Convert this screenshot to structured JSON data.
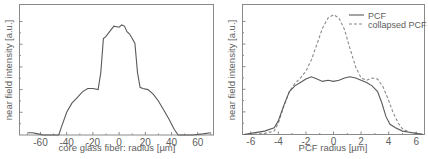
{
  "chart_data": [
    {
      "type": "line",
      "title": "",
      "xlabel": "core glass fiber: radius [µm]",
      "ylabel": "near field intensity [a.u.]",
      "xlim": [
        -76,
        72
      ],
      "ylim": [
        0,
        1.15
      ],
      "xticks": [
        -60,
        -40,
        -20,
        0,
        20,
        40,
        60
      ],
      "yticks_labeled": false,
      "grid": false,
      "legend": null,
      "series": [
        {
          "name": "core glass fiber",
          "style": "solid",
          "x": [
            -70,
            -66,
            -62,
            -58,
            -54,
            -50,
            -46,
            -44,
            -40,
            -36,
            -32,
            -28,
            -24,
            -20,
            -16,
            -14,
            -12,
            -10,
            -8,
            -4,
            0,
            2,
            4,
            6,
            8,
            10,
            12,
            14,
            16,
            18,
            22,
            26,
            30,
            34,
            38,
            42,
            45,
            48,
            56,
            64,
            70
          ],
          "y": [
            0.02,
            0.02,
            0.01,
            0.0,
            0.0,
            0.0,
            0.0,
            0.07,
            0.2,
            0.28,
            0.33,
            0.38,
            0.41,
            0.41,
            0.4,
            0.55,
            0.85,
            0.87,
            0.9,
            0.96,
            0.95,
            0.97,
            0.96,
            0.91,
            0.89,
            0.85,
            0.81,
            0.55,
            0.42,
            0.41,
            0.4,
            0.36,
            0.3,
            0.22,
            0.14,
            0.05,
            0.0,
            0.0,
            0.0,
            0.01,
            0.02
          ]
        }
      ]
    },
    {
      "type": "line",
      "title": "",
      "xlabel": "PCF radius [µm]",
      "ylabel": "near field intensity [a.u.]",
      "xlim": [
        -6.6,
        6.6
      ],
      "ylim": [
        0,
        1.15
      ],
      "xticks": [
        -6,
        -4,
        -2,
        0,
        2,
        4,
        6
      ],
      "yticks_labeled": false,
      "grid": false,
      "legend": {
        "position": "upper right",
        "entries": [
          "PCF",
          "collapsed PCF"
        ]
      },
      "series": [
        {
          "name": "PCF",
          "style": "solid",
          "x": [
            -6.5,
            -6,
            -5,
            -4.3,
            -4,
            -3.6,
            -3.2,
            -2.8,
            -2.4,
            -2,
            -1.6,
            -1.2,
            -0.8,
            -0.4,
            0,
            0.4,
            0.8,
            1.2,
            1.6,
            2,
            2.4,
            2.8,
            3.2,
            3.5,
            3.8,
            4.1,
            4.5,
            5,
            5.5,
            6,
            6.5
          ],
          "y": [
            0.0,
            0.01,
            0.03,
            0.06,
            0.12,
            0.26,
            0.38,
            0.43,
            0.46,
            0.49,
            0.51,
            0.49,
            0.47,
            0.48,
            0.47,
            0.48,
            0.5,
            0.51,
            0.5,
            0.48,
            0.46,
            0.43,
            0.38,
            0.28,
            0.16,
            0.09,
            0.06,
            0.03,
            0.02,
            0.01,
            0.0
          ]
        },
        {
          "name": "collapsed PCF",
          "style": "dashed",
          "x": [
            -6.5,
            -6,
            -5,
            -4.3,
            -4,
            -3.6,
            -3.2,
            -2.8,
            -2.4,
            -2,
            -1.6,
            -1.2,
            -0.8,
            -0.4,
            0,
            0.4,
            0.8,
            1.2,
            1.6,
            2,
            2.4,
            2.8,
            3.2,
            3.6,
            4,
            4.3,
            4.7,
            5,
            5.5,
            6,
            6.5
          ],
          "y": [
            0.0,
            0.0,
            0.01,
            0.03,
            0.1,
            0.25,
            0.38,
            0.45,
            0.5,
            0.56,
            0.66,
            0.8,
            0.94,
            1.03,
            1.06,
            1.03,
            0.93,
            0.76,
            0.6,
            0.5,
            0.48,
            0.5,
            0.49,
            0.42,
            0.3,
            0.2,
            0.1,
            0.05,
            0.02,
            0.01,
            0.0
          ]
        }
      ]
    }
  ],
  "panels": {
    "left": {
      "xlabel": "core glass fiber: radius [µm]",
      "ylabel": "near field intensity [a.u.]",
      "xtick_labels": [
        "-60",
        "-40",
        "-20",
        "0",
        "20",
        "40",
        "60"
      ]
    },
    "right": {
      "xlabel": "PCF radius [µm]",
      "ylabel": "near field intensity [a.u.]",
      "xtick_labels": [
        "-6",
        "-4",
        "-2",
        "0",
        "2",
        "4",
        "6"
      ],
      "legend": [
        {
          "label": "PCF",
          "style": "solid"
        },
        {
          "label": "collapsed PCF",
          "style": "dashed"
        }
      ]
    }
  },
  "colors": {
    "axis": "#8a8a8a",
    "solid_line": "#5a5a5a",
    "dashed_line": "#8a8a8a",
    "text": "#606060"
  }
}
